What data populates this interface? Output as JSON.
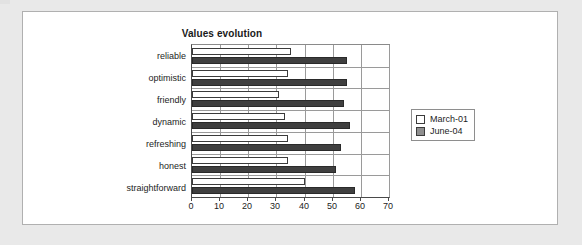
{
  "chart_data": {
    "type": "bar",
    "orientation": "horizontal",
    "title": "Values evolution",
    "xlabel": "",
    "ylabel": "",
    "xlim": [
      0,
      70
    ],
    "xticks": [
      0,
      10,
      20,
      30,
      40,
      50,
      60,
      70
    ],
    "xtick_labels": [
      "0",
      "10",
      "20",
      "30",
      "40",
      "50",
      "60",
      "70"
    ],
    "grid": true,
    "legend_position": "right",
    "categories": [
      "reliable",
      "optimistic",
      "friendly",
      "dynamic",
      "refreshing",
      "honest",
      "straightforward"
    ],
    "series": [
      {
        "name": "March-01",
        "color": "#ffffff",
        "edge_color": "#3b3b3b",
        "values": [
          35,
          34,
          31,
          33,
          34,
          34,
          40
        ]
      },
      {
        "name": "June-04",
        "color": "#3f3f3f",
        "edge_color": "#2a2a2a",
        "values": [
          55,
          55,
          54,
          56,
          53,
          51,
          58
        ]
      }
    ]
  },
  "legend": {
    "entries": [
      {
        "label": "March-01",
        "swatch": "white-swatch"
      },
      {
        "label": "June-04",
        "swatch": "gray-swatch"
      }
    ]
  },
  "colors": {
    "page_background": "#e9e9e9",
    "card_background": "#ffffff",
    "card_border": "#b0b0b0",
    "axis": "#4a4a4a",
    "gridline": "#9a9a9a",
    "text": "#1d1d1d",
    "series_march": "#ffffff",
    "series_june": "#3f3f3f"
  }
}
